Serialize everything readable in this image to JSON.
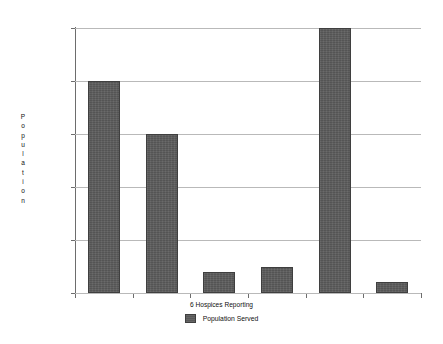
{
  "chart_data": {
    "type": "bar",
    "title": "",
    "xlabel": "6 Hospices Reporting",
    "ylabel": "Population",
    "ylim": [
      0,
      2500000
    ],
    "grid": true,
    "legend_position": "bottom-center",
    "categories": [
      "1",
      "2",
      "3",
      "4",
      "5",
      "6"
    ],
    "series": [
      {
        "name": "Population Served",
        "color": "#5d5d5d",
        "values": [
          2000000,
          1500000,
          200000,
          250000,
          2500000,
          100000
        ]
      }
    ],
    "ytick_labels": [
      "0",
      "500,000",
      "1,000,000",
      "1,500,000",
      "2,000,000",
      "2,500,000"
    ],
    "ytick_values": [
      0,
      500000,
      1000000,
      1500000,
      2000000,
      2500000
    ]
  },
  "axis": {
    "y_title_letters": [
      "P",
      "o",
      "p",
      "u",
      "l",
      "a",
      "t",
      "i",
      "o",
      "n"
    ]
  },
  "legend": {
    "entries": [
      {
        "label": "Population Served",
        "swatch": "legend-swatch-population-served"
      }
    ]
  }
}
